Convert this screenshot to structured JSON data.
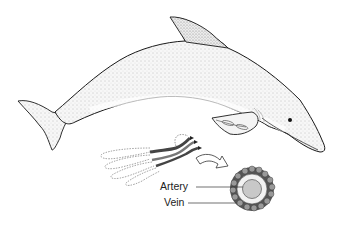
{
  "figure": {
    "inset": "flipper countercurrent heat exchanger",
    "labels": {
      "artery": "Artery",
      "vein": "Vein"
    },
    "colors": {
      "outline": "#1a1a1a",
      "body_shading": "#d9d9d9",
      "artery_fill": "#c8c8c8",
      "vein_ring": "#555555",
      "vessel_dark": "#444444"
    }
  }
}
